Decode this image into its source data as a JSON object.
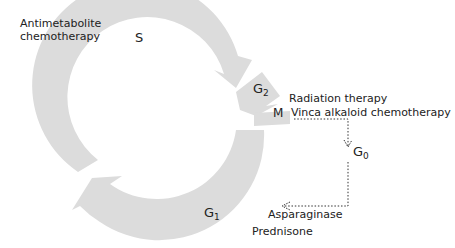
{
  "diagram": {
    "colors": {
      "ring": "#dcdcdc",
      "text": "#222222",
      "dotted": "#333333"
    },
    "phases": {
      "S": {
        "label": "S",
        "sub": ""
      },
      "G2": {
        "label": "G",
        "sub": "2"
      },
      "M": {
        "label": "M",
        "sub": ""
      },
      "G1": {
        "label": "G",
        "sub": "1"
      },
      "G0": {
        "label": "G",
        "sub": "0"
      }
    },
    "annotations": {
      "antimetabolite_line1": "Antimetabolite",
      "antimetabolite_line2": "chemotherapy",
      "radiation": "Radiation therapy",
      "vinca": "Vinca alkaloid chemotherapy",
      "asparaginase": "Asparaginase",
      "prednisone": "Prednisone"
    }
  }
}
